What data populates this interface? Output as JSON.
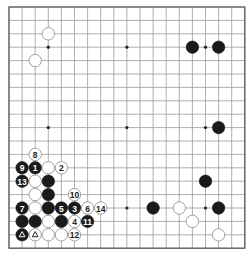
{
  "board": {
    "size": 19,
    "origin_x": 9,
    "origin_y": 7,
    "spacing_x": 13.1,
    "spacing_y": 13.4,
    "stone_radius": 6.2,
    "colors": {
      "black": "#1a1a1a",
      "white": "#ffffff",
      "grid": "#9a9a9a",
      "edge": "#555555"
    },
    "hoshi": [
      [
        3,
        3
      ],
      [
        9,
        3
      ],
      [
        15,
        3
      ],
      [
        3,
        9
      ],
      [
        9,
        9
      ],
      [
        15,
        9
      ],
      [
        3,
        15
      ],
      [
        9,
        15
      ],
      [
        15,
        15
      ]
    ],
    "stones": [
      {
        "color": "white",
        "col": 3,
        "row": 2,
        "label": ""
      },
      {
        "color": "white",
        "col": 2,
        "row": 4,
        "label": ""
      },
      {
        "color": "black",
        "col": 14,
        "row": 3,
        "label": ""
      },
      {
        "color": "black",
        "col": 16,
        "row": 3,
        "label": ""
      },
      {
        "color": "black",
        "col": 16,
        "row": 9,
        "label": ""
      },
      {
        "color": "black",
        "col": 15,
        "row": 13,
        "label": ""
      },
      {
        "color": "black",
        "col": 11,
        "row": 15,
        "label": ""
      },
      {
        "color": "white",
        "col": 13,
        "row": 15,
        "label": ""
      },
      {
        "color": "black",
        "col": 16,
        "row": 15,
        "label": ""
      },
      {
        "color": "white",
        "col": 14,
        "row": 16,
        "label": ""
      },
      {
        "color": "white",
        "col": 16,
        "row": 17,
        "label": ""
      },
      {
        "color": "white",
        "col": 2,
        "row": 11,
        "label": "8"
      },
      {
        "color": "black",
        "col": 1,
        "row": 12,
        "label": "9"
      },
      {
        "color": "black",
        "col": 2,
        "row": 12,
        "label": "1"
      },
      {
        "color": "white",
        "col": 3,
        "row": 12,
        "label": ""
      },
      {
        "color": "white",
        "col": 4,
        "row": 12,
        "label": "2"
      },
      {
        "color": "black",
        "col": 1,
        "row": 13,
        "label": "13"
      },
      {
        "color": "white",
        "col": 2,
        "row": 13,
        "label": ""
      },
      {
        "color": "black",
        "col": 3,
        "row": 13,
        "label": ""
      },
      {
        "color": "white",
        "col": 2,
        "row": 14,
        "label": ""
      },
      {
        "color": "black",
        "col": 3,
        "row": 14,
        "label": ""
      },
      {
        "color": "white",
        "col": 5,
        "row": 14,
        "label": "10"
      },
      {
        "color": "black",
        "col": 1,
        "row": 15,
        "label": "7"
      },
      {
        "color": "white",
        "col": 2,
        "row": 15,
        "label": ""
      },
      {
        "color": "black",
        "col": 3,
        "row": 15,
        "label": ""
      },
      {
        "color": "black",
        "col": 4,
        "row": 15,
        "label": "5"
      },
      {
        "color": "black",
        "col": 5,
        "row": 15,
        "label": "3"
      },
      {
        "color": "white",
        "col": 6,
        "row": 15,
        "label": "6"
      },
      {
        "color": "white",
        "col": 7,
        "row": 15,
        "label": "14"
      },
      {
        "color": "black",
        "col": 1,
        "row": 16,
        "label": ""
      },
      {
        "color": "black",
        "col": 2,
        "row": 16,
        "label": ""
      },
      {
        "color": "white",
        "col": 3,
        "row": 16,
        "label": ""
      },
      {
        "color": "black",
        "col": 4,
        "row": 16,
        "label": ""
      },
      {
        "color": "white",
        "col": 5,
        "row": 16,
        "label": "4"
      },
      {
        "color": "black",
        "col": 6,
        "row": 16,
        "label": "11"
      },
      {
        "color": "black",
        "col": 1,
        "row": 17,
        "label": "",
        "mark": "triangle"
      },
      {
        "color": "white",
        "col": 2,
        "row": 17,
        "label": "",
        "mark": "triangle"
      },
      {
        "color": "white",
        "col": 3,
        "row": 17,
        "label": ""
      },
      {
        "color": "white",
        "col": 4,
        "row": 17,
        "label": ""
      },
      {
        "color": "white",
        "col": 5,
        "row": 17,
        "label": "12"
      }
    ]
  }
}
